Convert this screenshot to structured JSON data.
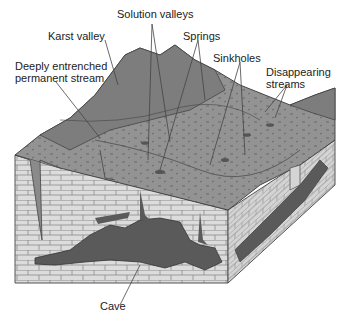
{
  "figure": {
    "colors": {
      "terrain": "#8f8f8f",
      "terrain_dark": "#6e6e6e",
      "limestone": "#d9d9d9",
      "mortar": "#8a8a8a",
      "cave": "#5a5a5a",
      "leader": "#444444"
    }
  },
  "labels": {
    "solution_valleys": "Solution valleys",
    "karst_valley": "Karst valley",
    "deeply_entrenched_line1": "Deeply entrenched",
    "deeply_entrenched_line2": "permanent stream",
    "springs": "Springs",
    "sinkholes": "Sinkholes",
    "disappearing_line1": "Disappearing",
    "disappearing_line2": "streams",
    "cave": "Cave"
  }
}
